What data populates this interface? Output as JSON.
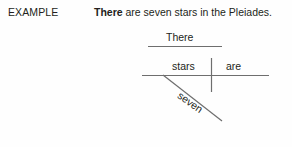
{
  "page": {
    "background_color": "#fefefe",
    "ink_color": "#231f20",
    "rule_color": "#6e6e6e"
  },
  "header": {
    "example_label": "EXAMPLE",
    "sentence": {
      "subject_bold": "There",
      "rest": " are seven stars in the Pleiades."
    }
  },
  "diagram": {
    "type": "reed-kellogg-sentence-diagram",
    "expletive_word": "There",
    "subject_word": "stars",
    "verb_word": "are",
    "modifier_word": "seven",
    "lines": [
      {
        "name": "expletive-line",
        "orientation": "horizontal",
        "x1": 148,
        "y1": 46,
        "x2": 222,
        "y2": 46
      },
      {
        "name": "baseline",
        "orientation": "horizontal",
        "x1": 142,
        "y1": 75,
        "x2": 269,
        "y2": 75
      },
      {
        "name": "subject-verb-divider",
        "orientation": "vertical",
        "x1": 211,
        "y1": 58,
        "x2": 211,
        "y2": 92
      },
      {
        "name": "modifier-slant-line",
        "orientation": "diagonal",
        "x1": 163,
        "y1": 75,
        "x2": 222,
        "y2": 121
      }
    ]
  }
}
